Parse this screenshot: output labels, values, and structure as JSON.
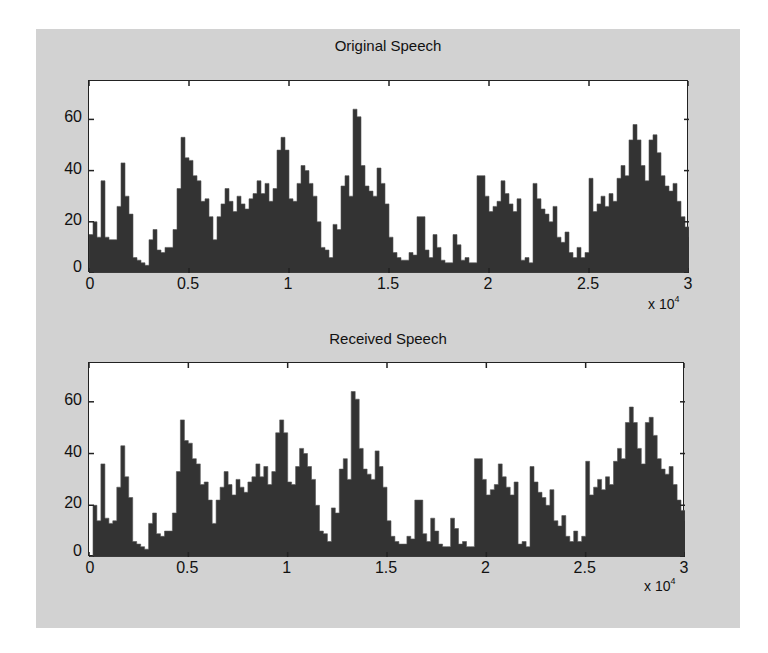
{
  "figure": {
    "background": "#d2d2d2",
    "bar_color": "#333333"
  },
  "chart_data": [
    {
      "type": "bar",
      "title": "Original Speech",
      "xlabel": "",
      "ylabel": "",
      "x_multiplier": "x 10",
      "x_exponent": "4",
      "xlim": [
        0,
        3
      ],
      "ylim": [
        0,
        75
      ],
      "xticks": [
        "0",
        "0.5",
        "1",
        "1.5",
        "2",
        "2.5",
        "3"
      ],
      "yticks": [
        "0",
        "20",
        "40",
        "60"
      ],
      "grid": false,
      "bin_width": 0.02,
      "values": [
        15,
        20,
        14,
        36,
        14,
        13,
        13,
        26,
        43,
        30,
        23,
        6,
        5,
        4,
        3,
        13,
        17,
        9,
        8,
        10,
        10,
        17,
        33,
        53,
        45,
        44,
        38,
        36,
        28,
        29,
        22,
        13,
        22,
        27,
        33,
        28,
        24,
        30,
        27,
        25,
        29,
        31,
        36,
        31,
        35,
        28,
        33,
        48,
        53,
        48,
        29,
        28,
        35,
        42,
        40,
        35,
        30,
        20,
        10,
        9,
        6,
        19,
        17,
        34,
        38,
        30,
        64,
        61,
        42,
        34,
        32,
        30,
        41,
        35,
        27,
        14,
        8,
        6,
        5,
        5,
        8,
        7,
        22,
        22,
        9,
        6,
        15,
        10,
        5,
        4,
        4,
        15,
        11,
        5,
        6,
        4,
        4,
        38,
        38,
        30,
        24,
        26,
        28,
        36,
        31,
        27,
        24,
        29,
        5,
        6,
        4,
        35,
        29,
        25,
        23,
        20,
        26,
        14,
        12,
        16,
        8,
        6,
        10,
        6,
        8,
        37,
        24,
        27,
        30,
        26,
        31,
        28,
        37,
        42,
        38,
        52,
        58,
        52,
        42,
        36,
        52,
        54,
        47,
        38,
        34,
        32,
        35,
        28,
        22,
        18,
        14,
        10,
        8,
        6,
        6,
        7,
        5,
        5,
        8,
        5
      ],
      "peak": {
        "x": 1.27,
        "y": 64
      }
    },
    {
      "type": "bar",
      "title": "Received Speech",
      "xlabel": "",
      "ylabel": "",
      "x_multiplier": "x 10",
      "x_exponent": "4",
      "xlim": [
        0,
        3
      ],
      "ylim": [
        0,
        75
      ],
      "xticks": [
        "0",
        "0.5",
        "1",
        "1.5",
        "2",
        "2.5",
        "3"
      ],
      "yticks": [
        "0",
        "20",
        "40",
        "60"
      ],
      "grid": false,
      "bin_width": 0.02,
      "values": [
        0,
        20,
        14,
        36,
        15,
        13,
        14,
        27,
        43,
        31,
        23,
        6,
        5,
        4,
        3,
        13,
        17,
        9,
        8,
        10,
        10,
        17,
        33,
        53,
        45,
        44,
        38,
        36,
        28,
        29,
        22,
        13,
        22,
        27,
        33,
        28,
        24,
        30,
        27,
        25,
        29,
        31,
        36,
        31,
        35,
        28,
        33,
        48,
        53,
        48,
        29,
        28,
        35,
        42,
        40,
        35,
        30,
        20,
        10,
        9,
        6,
        19,
        17,
        34,
        38,
        30,
        64,
        61,
        42,
        34,
        32,
        30,
        41,
        35,
        27,
        14,
        8,
        6,
        5,
        5,
        8,
        7,
        22,
        22,
        9,
        6,
        15,
        10,
        5,
        4,
        4,
        15,
        11,
        5,
        6,
        4,
        4,
        38,
        38,
        30,
        24,
        26,
        28,
        36,
        31,
        27,
        24,
        29,
        5,
        6,
        4,
        35,
        29,
        25,
        23,
        20,
        26,
        14,
        12,
        16,
        8,
        6,
        10,
        6,
        8,
        37,
        24,
        27,
        30,
        26,
        31,
        28,
        37,
        42,
        38,
        52,
        58,
        52,
        42,
        36,
        52,
        54,
        47,
        38,
        34,
        32,
        35,
        28,
        22,
        18,
        14,
        10,
        0,
        0,
        0,
        0,
        0,
        0,
        0,
        0
      ],
      "peak": {
        "x": 1.28,
        "y": 64
      }
    }
  ]
}
